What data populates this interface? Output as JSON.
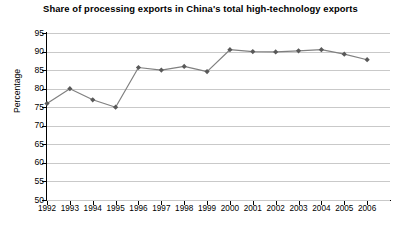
{
  "chart_data": {
    "type": "line",
    "title": "Share of processing exports in China's total high-technology exports",
    "xlabel": "",
    "ylabel": "Percentage",
    "categories": [
      "1992",
      "1993",
      "1994",
      "1995",
      "1996",
      "1997",
      "1998",
      "1999",
      "2000",
      "2001",
      "2002",
      "2003",
      "2004",
      "2005",
      "2006"
    ],
    "values": [
      76.0,
      80.0,
      77.0,
      75.0,
      85.7,
      85.0,
      86.0,
      84.6,
      90.5,
      90.0,
      89.9,
      90.2,
      90.5,
      89.3,
      87.8
    ],
    "ylim": [
      50,
      95
    ],
    "y_ticks": [
      50,
      55,
      60,
      65,
      70,
      75,
      80,
      85,
      90,
      95
    ],
    "grid": true,
    "legend": false,
    "series_color": "#808080",
    "marker_color": "#595959",
    "marker_shape": "diamond",
    "gridline_color": "#c9c9c9",
    "axis_color": "#000000",
    "background_color": "#ffffff"
  }
}
